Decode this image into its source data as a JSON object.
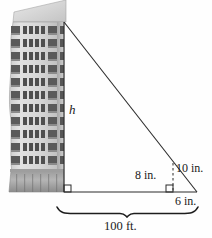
{
  "figure": {
    "type": "geometry-similar-triangles-diagram",
    "labels": {
      "height_unknown": "h",
      "small_vertical": "8 in.",
      "small_hypotenuse": "10 in.",
      "small_base": "6 in.",
      "ground_distance": "100 ft."
    },
    "colors": {
      "line": "#2b2b2b",
      "building_light": "#d9d9d9",
      "building_mid": "#bdbdbd",
      "building_dark": "#8f8f8f",
      "window": "#4a4a4a",
      "background": "#ffffff"
    },
    "building": {
      "floors": 11,
      "windows_per_floor": 7,
      "ground_floor_label": "storefront"
    },
    "geometry": {
      "apex": [
        64,
        22
      ],
      "base_left": [
        64,
        192
      ],
      "base_right": [
        197,
        192
      ],
      "small_triangle_vertical_x": 173,
      "small_triangle_top": [
        173,
        163
      ],
      "brace_left_x": 57,
      "brace_right_x": 198,
      "brace_y": 212
    }
  }
}
